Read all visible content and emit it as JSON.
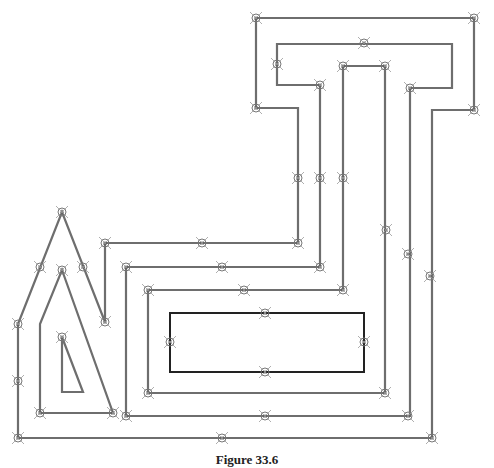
{
  "figure": {
    "caption": "Figure 33.6",
    "colors": {
      "path": "#6e6e6e",
      "rectangle": "#222222",
      "marker": "#777777",
      "background": "#ffffff"
    },
    "paths": [
      {
        "name": "outer-path",
        "points": [
          [
            18,
            438
          ],
          [
            18,
            324
          ],
          [
            62,
            212
          ],
          [
            105,
            322
          ],
          [
            105,
            243
          ],
          [
            298,
            243
          ],
          [
            298,
            108
          ],
          [
            256,
            108
          ],
          [
            256,
            18
          ],
          [
            474,
            18
          ],
          [
            474,
            110
          ],
          [
            432,
            110
          ],
          [
            432,
            438
          ],
          [
            18,
            438
          ]
        ]
      },
      {
        "name": "second-path",
        "points": [
          [
            40,
            413
          ],
          [
            40,
            324
          ],
          [
            62,
            270
          ],
          [
            113,
            413
          ],
          [
            40,
            413
          ]
        ]
      },
      {
        "name": "third-path",
        "points": [
          [
            126,
            416
          ],
          [
            126,
            267
          ],
          [
            320,
            267
          ],
          [
            320,
            85
          ],
          [
            277,
            85
          ],
          [
            277,
            44
          ],
          [
            452,
            44
          ],
          [
            452,
            88
          ],
          [
            410,
            88
          ],
          [
            410,
            416
          ],
          [
            126,
            416
          ]
        ]
      },
      {
        "name": "fourth-path",
        "points": [
          [
            148,
            393
          ],
          [
            148,
            290
          ],
          [
            343,
            290
          ],
          [
            343,
            66
          ],
          [
            385,
            66
          ],
          [
            385,
            393
          ],
          [
            148,
            393
          ]
        ]
      },
      {
        "name": "inner-triangle",
        "points": [
          [
            62,
            337
          ],
          [
            62,
            392
          ],
          [
            83,
            392
          ],
          [
            62,
            337
          ]
        ]
      }
    ],
    "rectangle": {
      "x": 170,
      "y": 313,
      "width": 194,
      "height": 59
    },
    "markers": [
      [
        256,
        18
      ],
      [
        474,
        18
      ],
      [
        364,
        43
      ],
      [
        277,
        64
      ],
      [
        320,
        85
      ],
      [
        256,
        108
      ],
      [
        343,
        66
      ],
      [
        385,
        66
      ],
      [
        474,
        110
      ],
      [
        410,
        88
      ],
      [
        298,
        178
      ],
      [
        320,
        178
      ],
      [
        343,
        178
      ],
      [
        386,
        230
      ],
      [
        408,
        254
      ],
      [
        430,
        276
      ],
      [
        298,
        243
      ],
      [
        320,
        267
      ],
      [
        343,
        290
      ],
      [
        62,
        212
      ],
      [
        40,
        267
      ],
      [
        62,
        270
      ],
      [
        83,
        267
      ],
      [
        105,
        243
      ],
      [
        202,
        243
      ],
      [
        126,
        267
      ],
      [
        222,
        267
      ],
      [
        148,
        290
      ],
      [
        244,
        290
      ],
      [
        265,
        313
      ],
      [
        170,
        342
      ],
      [
        364,
        342
      ],
      [
        265,
        372
      ],
      [
        18,
        324
      ],
      [
        105,
        322
      ],
      [
        18,
        381
      ],
      [
        62,
        337
      ],
      [
        40,
        413
      ],
      [
        113,
        413
      ],
      [
        148,
        393
      ],
      [
        385,
        393
      ],
      [
        126,
        416
      ],
      [
        265,
        416
      ],
      [
        408,
        416
      ],
      [
        18,
        438
      ],
      [
        222,
        438
      ],
      [
        432,
        438
      ]
    ]
  }
}
